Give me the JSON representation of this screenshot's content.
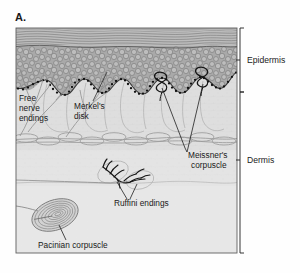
{
  "figure": {
    "panel_label": "A.",
    "frame": {
      "x": 16,
      "y": 28,
      "width": 221,
      "height": 225,
      "border_color": "#5a5a5a"
    }
  },
  "layers": [
    {
      "name": "stratum-corneum",
      "fill": "#b9b9b9",
      "line_color": "#6e6e6e"
    },
    {
      "name": "epidermis-cell-layer",
      "fill": "#a8a8a8",
      "cell_color": "#6a6a6a"
    },
    {
      "name": "basal-layer-dots",
      "fill": "#1b1b1b"
    },
    {
      "name": "dermis-upper",
      "fill": "#dcdcdc"
    },
    {
      "name": "dermis-lower",
      "fill": "#e2e2e2"
    },
    {
      "name": "vascular-plexus",
      "line_color": "#9a9a9a"
    }
  ],
  "side_labels": [
    {
      "id": "epidermis",
      "text": "Epidermis",
      "x": 247,
      "y": 62,
      "bracket_top": 28,
      "bracket_bottom": 92
    },
    {
      "id": "dermis",
      "text": "Dermis",
      "x": 247,
      "y": 162,
      "bracket_top": 92,
      "bracket_bottom": 253
    }
  ],
  "annotations": [
    {
      "id": "free-nerve-endings",
      "lines": [
        "Free",
        "nerve",
        "endings"
      ],
      "x": 19,
      "y": 100
    },
    {
      "id": "merkels-disk",
      "lines": [
        "Merkel's",
        "disk"
      ],
      "x": 74,
      "y": 108
    },
    {
      "id": "meissners-corpuscle",
      "lines": [
        "Meissner's",
        "corpuscle"
      ],
      "x": 188,
      "y": 156
    },
    {
      "id": "ruffini-endings",
      "lines": [
        "Ruffini endings"
      ],
      "x": 114,
      "y": 205
    },
    {
      "id": "pacinian-corpuscle",
      "lines": [
        "Pacinian corpuscle"
      ],
      "x": 38,
      "y": 247
    }
  ],
  "structures": [
    {
      "id": "meissner-corpuscle-left",
      "type": "coiled-corpuscle",
      "cx": 161,
      "cy": 83
    },
    {
      "id": "meissner-corpuscle-right",
      "type": "coiled-corpuscle",
      "cx": 202,
      "cy": 78
    },
    {
      "id": "ruffini-ending-left",
      "type": "branching-capsule",
      "cx": 112,
      "cy": 173
    },
    {
      "id": "ruffini-ending-right",
      "type": "branching-capsule",
      "cx": 138,
      "cy": 180
    },
    {
      "id": "pacinian-corpuscle-body",
      "type": "lamellated-oval",
      "cx": 55,
      "cy": 215
    }
  ],
  "colors": {
    "ink": "#1a1a1a",
    "nerve_dark": "#111111",
    "nerve_light": "#8c8c8c",
    "leader": "#222222",
    "page_bg": "#ffffff"
  }
}
